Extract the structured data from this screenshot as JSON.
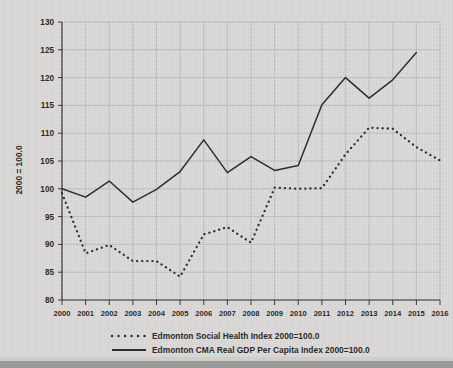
{
  "chart_data": {
    "type": "line",
    "title": "",
    "xlabel": "",
    "ylabel": "2000 = 100.0",
    "xlim": [
      2000,
      2016
    ],
    "ylim": [
      80,
      130
    ],
    "grid": true,
    "legend_position": "bottom",
    "x": [
      2000,
      2001,
      2002,
      2003,
      2004,
      2005,
      2006,
      2007,
      2008,
      2009,
      2010,
      2011,
      2012,
      2013,
      2014,
      2015,
      2016
    ],
    "xticks": [
      "2000",
      "2001",
      "2002",
      "2003",
      "2004",
      "2005",
      "2006",
      "2007",
      "2008",
      "2009",
      "2010",
      "2011",
      "2012",
      "2013",
      "2014",
      "2015",
      "2016"
    ],
    "yticks": [
      "80",
      "85",
      "90",
      "95",
      "100",
      "105",
      "110",
      "115",
      "120",
      "125",
      "130"
    ],
    "series": [
      {
        "name": "Edmonton Social Health Index 2000=100.0",
        "style": "dotted",
        "color": "#2e2e2e",
        "x": [
          2000,
          2001,
          2002,
          2003,
          2004,
          2005,
          2006,
          2007,
          2008,
          2009,
          2010,
          2011,
          2012,
          2013,
          2014,
          2015,
          2016
        ],
        "values": [
          99.2,
          88.4,
          89.9,
          87.0,
          87.0,
          84.2,
          91.8,
          93.1,
          90.3,
          100.2,
          100.0,
          100.1,
          106.2,
          111.0,
          110.8,
          107.5,
          105.1
        ]
      },
      {
        "name": "Edmonton CMA Real GDP Per Capita Index 2000=100.0",
        "style": "solid",
        "color": "#2e2e2e",
        "x": [
          2000,
          2001,
          2002,
          2003,
          2004,
          2005,
          2006,
          2007,
          2008,
          2009,
          2010,
          2011,
          2012,
          2013,
          2014,
          2015
        ],
        "values": [
          100.0,
          98.5,
          101.4,
          97.6,
          99.9,
          103.1,
          108.8,
          102.9,
          105.8,
          103.3,
          104.2,
          115.1,
          120.0,
          116.3,
          119.6,
          124.5
        ]
      }
    ]
  },
  "legend": {
    "entries": [
      {
        "label": "Edmonton Social Health Index 2000=100.0",
        "marker": "dotted-line-marker"
      },
      {
        "label": "Edmonton CMA Real GDP Per Capita Index 2000=100.0",
        "marker": "solid-line-marker"
      }
    ]
  }
}
